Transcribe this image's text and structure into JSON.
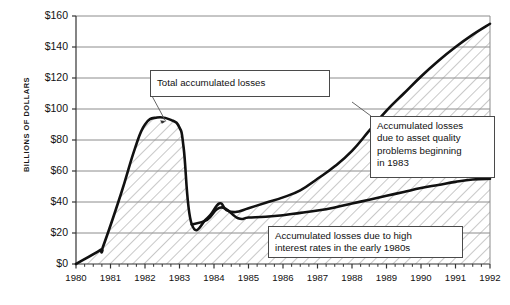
{
  "chart_data": {
    "type": "area",
    "title": "",
    "xlabel": "",
    "ylabel": "BILLIONS OF DOLLARS",
    "xlim": [
      1980,
      1992
    ],
    "ylim": [
      0,
      160
    ],
    "grid": true,
    "legend_position": "annotations",
    "y_ticks": [
      "$0",
      "$20",
      "$40",
      "$60",
      "$80",
      "$100",
      "$120",
      "$140",
      "$160"
    ],
    "y_tick_values": [
      0,
      20,
      40,
      60,
      80,
      100,
      120,
      140,
      160
    ],
    "x_ticks": [
      "1980",
      "1981",
      "1982",
      "1983",
      "1984",
      "1985",
      "1986",
      "1987",
      "1988",
      "1989",
      "1990",
      "1991",
      "1992"
    ],
    "x_tick_values": [
      1980,
      1981,
      1982,
      1983,
      1984,
      1985,
      1986,
      1987,
      1988,
      1989,
      1990,
      1991,
      1992
    ],
    "minor_ticks_per_year": 4,
    "series": [
      {
        "name": "Total accumulated losses",
        "x": [
          1980.0,
          1980.7,
          1980.78,
          1981.3,
          1981.7,
          1982.0,
          1982.35,
          1982.75,
          1983.0,
          1983.12,
          1983.35,
          1983.8,
          1984.15,
          1984.35,
          1984.62,
          1985.0,
          1985.5,
          1986.0,
          1986.5,
          1987.0,
          1987.5,
          1988.0,
          1988.5,
          1989.0,
          1989.5,
          1990.0,
          1990.5,
          1991.0,
          1991.5,
          1992.0
        ],
        "y": [
          0,
          9,
          11,
          45,
          74,
          90,
          94.5,
          93,
          88,
          75,
          26,
          29.5,
          39,
          35,
          33.5,
          36,
          39.5,
          43,
          47.5,
          55,
          63,
          73,
          86,
          99,
          110,
          121,
          131,
          140,
          148,
          155
        ]
      },
      {
        "name": "Accumulated losses due to high interest rates in the early 1980s",
        "x": [
          1983.35,
          1983.8,
          1984.2,
          1984.7,
          1985.0,
          1985.5,
          1986.0,
          1986.5,
          1987.0,
          1987.5,
          1988.0,
          1988.5,
          1989.0,
          1989.5,
          1990.0,
          1990.5,
          1991.0,
          1991.5,
          1992.0
        ],
        "y": [
          25.5,
          28.5,
          36.5,
          29.5,
          30,
          30.5,
          31.5,
          33,
          34.5,
          36.5,
          39,
          41.5,
          44,
          46.5,
          49,
          51,
          53,
          54.5,
          55
        ]
      }
    ],
    "annotations": [
      {
        "id": "total",
        "text": "Total accumulated losses",
        "points_to": [
          1982.6,
          92
        ]
      },
      {
        "id": "asset",
        "lines": [
          "Accumulated losses",
          "due to asset quality",
          "problems beginning",
          "in 1983"
        ]
      },
      {
        "id": "interest",
        "lines": [
          "Accumulated losses due to high",
          "interest rates in the early 1980s"
        ]
      }
    ],
    "colors": {
      "line": "#111111",
      "grid": "#8c8c8c",
      "axis": "#333333",
      "hatch": "#9a9a9a",
      "background": "#ffffff",
      "callout_border": "#4a4a4a"
    }
  }
}
